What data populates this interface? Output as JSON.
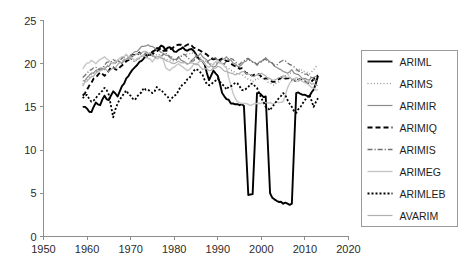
{
  "chart_data": {
    "type": "line",
    "title": "",
    "subtitle": "",
    "xlabel": "",
    "ylabel": "",
    "xlim": [
      1950,
      2020
    ],
    "ylim": [
      0,
      25
    ],
    "xticks": [
      1950,
      1960,
      1970,
      1980,
      1990,
      2000,
      2010,
      2020
    ],
    "yticks": [
      0,
      5,
      10,
      15,
      20,
      25
    ],
    "xtick_labels": [
      "1950",
      "1960",
      "1970",
      "1980",
      "1990",
      "2000",
      "2010",
      "2020"
    ],
    "ytick_labels": [
      "0",
      "5",
      "10",
      "15",
      "20",
      "25"
    ],
    "grid": false,
    "legend_position": "right-outside",
    "x_start": 1959,
    "x_end": 2013,
    "x_step": 1,
    "series": [
      {
        "name": "ARIML",
        "color": "#000000",
        "style": "solid",
        "width": 1.9,
        "dash": "none",
        "values": [
          15.0,
          14.8,
          14.4,
          15.5,
          15.2,
          16.3,
          15.8,
          16.8,
          16.2,
          17.4,
          18.3,
          19.0,
          19.6,
          20.2,
          20.6,
          21.0,
          21.4,
          21.8,
          22.1,
          21.6,
          21.9,
          21.4,
          21.6,
          21.9,
          21.5,
          21.7,
          21.1,
          20.4,
          19.9,
          18.1,
          19.2,
          18.6,
          16.6,
          15.9,
          15.4,
          15.3,
          15.2,
          15.1,
          4.8,
          4.9,
          16.6,
          16.4,
          16.2,
          5.0,
          4.3,
          4.0,
          3.8,
          3.8,
          3.8,
          16.6,
          16.5,
          16.4,
          16.2,
          17.0,
          18.6
        ]
      },
      {
        "name": "ARIMS",
        "color": "#9a9a9a",
        "style": "dotted",
        "width": 1.5,
        "dash": "1,2.2",
        "values": [
          17.6,
          18.2,
          18.8,
          19.1,
          19.3,
          19.6,
          19.9,
          20.1,
          20.4,
          20.6,
          20.8,
          21.0,
          21.1,
          21.3,
          21.1,
          21.0,
          21.2,
          21.0,
          20.8,
          20.6,
          20.4,
          20.3,
          20.6,
          20.9,
          21.1,
          21.3,
          21.0,
          20.7,
          20.4,
          20.1,
          19.9,
          20.2,
          20.0,
          19.6,
          19.2,
          18.9,
          18.8,
          18.6,
          18.2,
          17.9,
          18.1,
          18.4,
          18.2,
          17.8,
          17.5,
          17.9,
          18.3,
          18.6,
          18.9,
          19.2,
          19.4,
          19.1,
          18.8,
          19.3,
          19.7
        ]
      },
      {
        "name": "ARIMIR",
        "color": "#8c8c8c",
        "style": "solid",
        "width": 1.2,
        "dash": "none",
        "values": [
          18.0,
          18.4,
          18.9,
          19.2,
          19.5,
          19.3,
          19.7,
          20.1,
          20.4,
          20.0,
          20.5,
          21.0,
          21.4,
          21.7,
          22.0,
          22.2,
          22.0,
          21.6,
          21.3,
          21.0,
          20.7,
          20.5,
          20.8,
          20.3,
          20.0,
          20.4,
          20.9,
          21.2,
          20.6,
          20.0,
          19.6,
          20.1,
          20.5,
          20.8,
          20.4,
          20.0,
          19.7,
          20.2,
          20.6,
          20.2,
          19.8,
          20.3,
          20.7,
          20.2,
          19.7,
          19.4,
          19.1,
          18.9,
          19.3,
          18.8,
          18.5,
          18.3,
          18.1,
          18.4,
          18.7
        ]
      },
      {
        "name": "ARIMIQ",
        "color": "#000000",
        "style": "dashed",
        "width": 1.9,
        "dash": "5,3",
        "values": [
          16.3,
          17.0,
          17.8,
          18.4,
          19.0,
          18.6,
          19.2,
          19.6,
          19.3,
          19.8,
          20.3,
          20.7,
          21.0,
          21.3,
          21.0,
          20.8,
          21.1,
          21.4,
          21.8,
          21.5,
          21.7,
          22.0,
          22.2,
          22.1,
          22.2,
          22.1,
          21.8,
          21.5,
          21.2,
          20.8,
          20.5,
          20.3,
          20.6,
          20.3,
          20.0,
          19.7,
          19.4,
          19.2,
          18.9,
          18.6,
          18.8,
          18.5,
          18.3,
          18.1,
          17.9,
          18.2,
          18.5,
          18.3,
          18.1,
          17.9,
          18.2,
          18.0,
          17.8,
          18.2,
          18.6
        ]
      },
      {
        "name": "ARIMIS",
        "color": "#6f6f6f",
        "style": "dashdot",
        "width": 1.3,
        "dash": "5,2,1.2,2",
        "values": [
          18.4,
          18.9,
          19.3,
          19.6,
          19.2,
          19.8,
          20.2,
          20.5,
          20.1,
          20.6,
          21.0,
          20.6,
          20.2,
          20.6,
          21.0,
          21.3,
          20.9,
          20.5,
          20.9,
          21.2,
          20.8,
          20.4,
          20.8,
          21.1,
          20.7,
          20.3,
          20.7,
          20.4,
          20.0,
          20.4,
          20.8,
          20.4,
          20.0,
          20.3,
          20.6,
          20.2,
          19.9,
          20.3,
          20.6,
          20.2,
          19.9,
          20.2,
          20.5,
          20.2,
          19.8,
          20.1,
          20.4,
          20.1,
          19.8,
          19.4,
          19.1,
          18.8,
          18.5,
          18.2,
          17.9
        ]
      },
      {
        "name": "ARIMEG",
        "color": "#c6c6c6",
        "style": "solid",
        "width": 1.4,
        "dash": "none",
        "values": [
          19.4,
          20.1,
          20.4,
          20.0,
          20.5,
          20.8,
          20.4,
          20.0,
          20.4,
          20.8,
          21.1,
          20.7,
          20.3,
          20.7,
          21.0,
          20.6,
          20.2,
          20.6,
          20.9,
          19.6,
          19.2,
          19.6,
          20.0,
          19.6,
          19.2,
          19.6,
          20.0,
          20.4,
          20.0,
          19.6,
          20.0,
          20.4,
          20.0,
          19.5,
          17.5,
          16.0,
          15.5,
          15.4,
          15.3,
          15.3,
          15.4,
          15.4,
          15.5,
          15.5,
          15.4,
          15.5,
          15.6,
          17.2,
          18.0,
          18.4,
          18.1,
          17.8,
          17.5,
          17.2,
          17.0
        ]
      },
      {
        "name": "ARIMLEB",
        "color": "#000000",
        "style": "dotted",
        "width": 1.8,
        "dash": "2,2",
        "values": [
          16.0,
          16.4,
          15.6,
          16.0,
          16.6,
          17.2,
          16.4,
          13.8,
          15.4,
          16.2,
          16.9,
          16.3,
          15.8,
          16.5,
          17.2,
          17.0,
          16.6,
          17.3,
          17.0,
          16.4,
          15.7,
          16.3,
          16.9,
          17.6,
          18.2,
          18.8,
          19.4,
          19.0,
          18.1,
          17.5,
          17.9,
          18.3,
          17.6,
          17.0,
          17.4,
          17.8,
          17.4,
          16.9,
          17.3,
          17.7,
          17.2,
          16.0,
          15.0,
          14.6,
          15.3,
          16.0,
          16.6,
          15.8,
          15.0,
          14.3,
          15.0,
          15.8,
          16.4,
          15.0,
          16.0
        ]
      },
      {
        "name": "AVARIM",
        "color": "#b0b0b0",
        "style": "solid",
        "width": 1.2,
        "dash": "none",
        "values": [
          17.4,
          18.0,
          18.5,
          18.9,
          19.2,
          19.5,
          19.1,
          19.5,
          19.9,
          20.2,
          20.5,
          20.8,
          21.0,
          21.2,
          21.4,
          21.2,
          21.0,
          20.8,
          20.6,
          20.4,
          20.2,
          20.0,
          20.3,
          20.1,
          19.9,
          20.1,
          19.9,
          19.6,
          19.4,
          19.2,
          19.5,
          19.7,
          19.4,
          19.1,
          18.9,
          18.7,
          18.9,
          19.1,
          18.8,
          18.5,
          18.7,
          18.9,
          18.6,
          18.3,
          18.1,
          18.4,
          18.6,
          18.4,
          18.2,
          18.0,
          18.3,
          18.1,
          17.9,
          17.7,
          17.5
        ]
      }
    ]
  },
  "legend": {
    "items": [
      {
        "label": "ARIML"
      },
      {
        "label": "ARIMS"
      },
      {
        "label": "ARIMIR"
      },
      {
        "label": "ARIMIQ"
      },
      {
        "label": "ARIMIS"
      },
      {
        "label": "ARIMEG"
      },
      {
        "label": "ARIMLEB"
      },
      {
        "label": "AVARIM"
      }
    ]
  },
  "colors": {
    "axis": "#8d8d8d",
    "text": "#2b2b2b",
    "legend_border": "#9a9a9a",
    "background": "#ffffff"
  }
}
